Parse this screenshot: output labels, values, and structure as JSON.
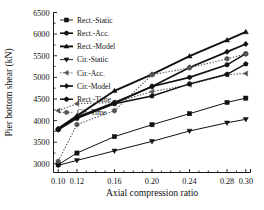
{
  "chart_data": {
    "type": "line",
    "title": "",
    "xlabel": "Axial compression ratio",
    "ylabel": "Pier bottom shear (kN)",
    "x": [
      0.1,
      0.12,
      0.16,
      0.2,
      0.24,
      0.28,
      0.3
    ],
    "xticks": [
      "0.10",
      "0.12",
      "0.16",
      "0.20",
      "0.24",
      "0.28",
      "0.30"
    ],
    "yticks": [
      "3000",
      "3500",
      "4000",
      "4500",
      "5000",
      "5500",
      "6000",
      "6500"
    ],
    "xlim": [
      0.095,
      0.305
    ],
    "ylim": [
      2800,
      6500
    ],
    "grid": false,
    "legend_position": "top-left-inside",
    "series": [
      {
        "name": "Rect.-Static",
        "marker": "square",
        "linestyle": "solid",
        "linewidth": 1.0,
        "color": "#111111",
        "values": [
          2980,
          3250,
          3630,
          3905,
          4160,
          4420,
          4520
        ]
      },
      {
        "name": "Rect.-Acc.",
        "marker": "circle",
        "linestyle": "solid",
        "linewidth": 1.6,
        "color": "#111111",
        "values": [
          3800,
          4080,
          4420,
          4790,
          5000,
          5290,
          5550
        ]
      },
      {
        "name": "Rect.-Model",
        "marker": "triangle-up",
        "linestyle": "solid",
        "linewidth": 1.9,
        "color": "#111111",
        "values": [
          3815,
          4110,
          4690,
          5070,
          5490,
          5860,
          6050
        ]
      },
      {
        "name": "Cir.-Static",
        "marker": "triangle-down",
        "linestyle": "solid",
        "linewidth": 1.0,
        "color": "#111111",
        "values": [
          2965,
          3080,
          3300,
          3520,
          3760,
          3950,
          4030
        ]
      },
      {
        "name": "Cir.-Acc.",
        "marker": "triangle-left",
        "linestyle": "dotted",
        "linewidth": 1.1,
        "color": "#555555",
        "values": [
          4230,
          4390,
          4420,
          4670,
          4830,
          5060,
          5090
        ]
      },
      {
        "name": "Cir.-Model",
        "marker": "diamond",
        "linestyle": "solid",
        "linewidth": 1.7,
        "color": "#111111",
        "values": [
          3790,
          4060,
          4400,
          4790,
          5230,
          5590,
          5770
        ]
      },
      {
        "name": "Rect.-Time",
        "marker": "pentagon",
        "linestyle": "solid",
        "linewidth": 1.5,
        "color": "#111111",
        "values": [
          3795,
          4055,
          4390,
          4570,
          4850,
          5070,
          5310
        ]
      },
      {
        "name": "Cir.-Time",
        "marker": "hexagon",
        "linestyle": "dotted",
        "linewidth": 1.1,
        "color": "#555555",
        "values": [
          3060,
          3910,
          4230,
          5060,
          5220,
          5430,
          5540
        ]
      }
    ]
  },
  "legend": {
    "items": [
      "Rect.-Static",
      "Rect.-Acc.",
      "Rect.-Model",
      "Cir.-Static",
      "Cir.-Acc.",
      "Cir.-Model",
      "Rect.-Time",
      "Cir.-Time"
    ]
  },
  "axes": {
    "x_title": "Axial compression ratio",
    "y_title": "Pier bottom shear (kN)"
  }
}
